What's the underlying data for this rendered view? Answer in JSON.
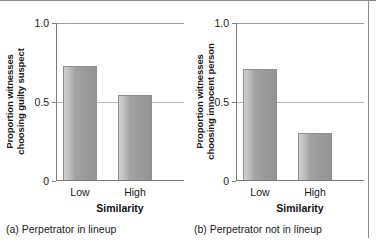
{
  "figure": {
    "background_color": "#ffffff",
    "frame_color": "#8d8d8d",
    "bar_color": "#9b9b9b",
    "gridline_color": "#b9b9b9",
    "axis_color": "#7d7d7d"
  },
  "panels": [
    {
      "id": "a",
      "caption": "(a) Perpetrator in lineup",
      "ylabel": "Proportion witnesses\nchoosing guilty suspect",
      "xlabel": "Similarity",
      "yticks": [
        "1.0",
        "0.5",
        "0"
      ],
      "categories": [
        "Low",
        "High"
      ],
      "values": [
        0.72,
        0.54
      ]
    },
    {
      "id": "b",
      "caption": "(b) Perpetrator not in lineup",
      "ylabel": "Proportion witnesses\nchoosing innocent person",
      "xlabel": "Similarity",
      "yticks": [
        "1.0",
        "0.5",
        "0"
      ],
      "categories": [
        "Low",
        "High"
      ],
      "values": [
        0.7,
        0.3
      ]
    }
  ],
  "chart_data": [
    {
      "type": "bar",
      "title": "(a) Perpetrator in lineup",
      "categories": [
        "Low",
        "High"
      ],
      "values": [
        0.72,
        0.54
      ],
      "xlabel": "Similarity",
      "ylabel": "Proportion witnesses choosing guilty suspect",
      "ylim": [
        0,
        1.0
      ],
      "yticks": [
        0,
        0.5,
        1.0
      ],
      "ytick_labels": [
        "0",
        "0.5",
        "1.0"
      ],
      "grid": "horizontal-at-0.5-and-1.0",
      "legend": "none"
    },
    {
      "type": "bar",
      "title": "(b) Perpetrator not in lineup",
      "categories": [
        "Low",
        "High"
      ],
      "values": [
        0.7,
        0.3
      ],
      "xlabel": "Similarity",
      "ylabel": "Proportion witnesses choosing innocent person",
      "ylim": [
        0,
        1.0
      ],
      "yticks": [
        0,
        0.5,
        1.0
      ],
      "ytick_labels": [
        "0",
        "0.5",
        "1.0"
      ],
      "grid": "horizontal-at-0.5-and-1.0",
      "legend": "none"
    }
  ]
}
